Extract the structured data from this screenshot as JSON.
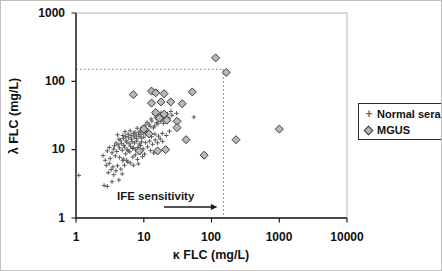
{
  "figure": {
    "legend": {
      "plus_glyph": "+",
      "entries": [
        {
          "label": "Normal sera",
          "marker": "plus"
        },
        {
          "label": "MGUS",
          "marker": "diamond"
        }
      ]
    }
  },
  "chart_data": {
    "type": "scatter",
    "title": "",
    "xlabel": "κ FLC (mg/L)",
    "ylabel": "λ FLC (mg/L)",
    "xscale": "log",
    "yscale": "log",
    "xlim": [
      1,
      10000
    ],
    "ylim": [
      1,
      1000
    ],
    "x_ticks": [
      "1",
      "10",
      "100",
      "1000",
      "10000"
    ],
    "y_ticks": [
      "1",
      "10",
      "100",
      "1000"
    ],
    "grid": false,
    "legend_position": "right-outside-boxed",
    "colors": {
      "plus": "#5a5a5a",
      "diamond_fill": "#b8b8b8",
      "diamond_stroke": "#3a3a3a",
      "dotted": "#777777",
      "axis": "#1a1a1a",
      "plot_border": "#b5b5b5"
    },
    "reference_lines": [
      {
        "axis": "x",
        "value": 150,
        "style": "dotted"
      },
      {
        "axis": "y",
        "value": 150,
        "style": "dotted"
      }
    ],
    "annotations": [
      {
        "text": "IFE sensitivity",
        "arrow": {
          "x1": 20,
          "x2": 122,
          "y": 1.45,
          "direction": "right"
        }
      }
    ],
    "series": [
      {
        "name": "Normal sera",
        "marker": "plus",
        "points": [
          [
            1.1,
            4.2
          ],
          [
            2.6,
            3.0
          ],
          [
            2.9,
            2.9
          ],
          [
            3.4,
            3.4
          ],
          [
            3.0,
            4.6
          ],
          [
            3.3,
            5.1
          ],
          [
            3.6,
            4.3
          ],
          [
            2.8,
            5.9
          ],
          [
            3.1,
            6.3
          ],
          [
            3.5,
            5.6
          ],
          [
            3.9,
            4.9
          ],
          [
            4.3,
            3.6
          ],
          [
            4.8,
            4.4
          ],
          [
            3.2,
            7.4
          ],
          [
            2.7,
            7.0
          ],
          [
            2.5,
            8.2
          ],
          [
            4.1,
            5.8
          ],
          [
            4.6,
            5.2
          ],
          [
            5.2,
            5.9
          ],
          [
            5.8,
            6.6
          ],
          [
            4.9,
            6.9
          ],
          [
            4.4,
            7.7
          ],
          [
            3.8,
            8.1
          ],
          [
            3.4,
            9.0
          ],
          [
            2.9,
            9.6
          ],
          [
            3.1,
            10.8
          ],
          [
            3.6,
            10.2
          ],
          [
            4.0,
            9.4
          ],
          [
            4.4,
            10.6
          ],
          [
            4.8,
            9.8
          ],
          [
            5.2,
            10.9
          ],
          [
            5.7,
            10.1
          ],
          [
            6.2,
            9.3
          ],
          [
            6.8,
            10.4
          ],
          [
            5.4,
            8.7
          ],
          [
            5.9,
            9.6
          ],
          [
            6.4,
            11.2
          ],
          [
            7.1,
            10.7
          ],
          [
            7.6,
            9.9
          ],
          [
            8.2,
            10.8
          ],
          [
            4.2,
            11.8
          ],
          [
            4.7,
            12.4
          ],
          [
            5.1,
            11.6
          ],
          [
            5.6,
            12.9
          ],
          [
            6.1,
            12.2
          ],
          [
            6.7,
            13.1
          ],
          [
            7.3,
            12.5
          ],
          [
            7.9,
            13.4
          ],
          [
            8.6,
            12.1
          ],
          [
            9.3,
            13.0
          ],
          [
            4.5,
            13.8
          ],
          [
            5.0,
            14.6
          ],
          [
            5.5,
            13.5
          ],
          [
            6.0,
            14.9
          ],
          [
            6.6,
            14.2
          ],
          [
            7.2,
            15.3
          ],
          [
            7.8,
            14.5
          ],
          [
            8.5,
            15.7
          ],
          [
            9.2,
            14.8
          ],
          [
            10.0,
            15.2
          ],
          [
            4.9,
            16.1
          ],
          [
            5.4,
            15.6
          ],
          [
            5.9,
            16.8
          ],
          [
            6.5,
            16.0
          ],
          [
            7.0,
            17.2
          ],
          [
            7.7,
            16.4
          ],
          [
            8.4,
            17.6
          ],
          [
            9.1,
            16.7
          ],
          [
            9.9,
            17.9
          ],
          [
            10.8,
            17.0
          ],
          [
            5.3,
            18.3
          ],
          [
            6.3,
            18.9
          ],
          [
            7.4,
            18.1
          ],
          [
            8.8,
            18.7
          ],
          [
            10.2,
            19.4
          ],
          [
            11.6,
            18.4
          ],
          [
            8.0,
            20.6
          ],
          [
            9.5,
            21.2
          ],
          [
            11.0,
            20.1
          ],
          [
            12.4,
            21.9
          ],
          [
            13.9,
            20.8
          ],
          [
            10.5,
            22.8
          ],
          [
            12.0,
            23.5
          ],
          [
            14.5,
            22.3
          ],
          [
            16.2,
            23.9
          ],
          [
            11.2,
            25.1
          ],
          [
            13.2,
            26.3
          ],
          [
            15.5,
            24.7
          ],
          [
            17.8,
            26.0
          ],
          [
            19.5,
            24.2
          ],
          [
            12.8,
            28.2
          ],
          [
            15.0,
            29.4
          ],
          [
            18.5,
            28.0
          ],
          [
            21.0,
            27.1
          ],
          [
            16.8,
            31.5
          ],
          [
            20.2,
            30.3
          ],
          [
            23.5,
            29.0
          ],
          [
            14.2,
            33.0
          ],
          [
            18.0,
            34.6
          ],
          [
            22.4,
            33.4
          ],
          [
            26.0,
            31.8
          ],
          [
            25.2,
            36.2
          ],
          [
            30.5,
            34.0
          ],
          [
            55.0,
            30.0
          ],
          [
            9.0,
            11.5
          ],
          [
            9.8,
            10.3
          ],
          [
            10.6,
            12.7
          ],
          [
            11.4,
            11.0
          ],
          [
            12.2,
            13.3
          ],
          [
            13.5,
            12.0
          ],
          [
            14.8,
            13.9
          ],
          [
            16.0,
            12.6
          ],
          [
            17.5,
            14.4
          ],
          [
            19.0,
            13.2
          ],
          [
            8.9,
            9.0
          ],
          [
            10.3,
            8.6
          ],
          [
            12.6,
            9.7
          ],
          [
            14.0,
            8.9
          ],
          [
            6.9,
            7.8
          ],
          [
            7.5,
            8.4
          ],
          [
            8.1,
            7.2
          ],
          [
            9.6,
            7.9
          ],
          [
            11.8,
            16.2
          ],
          [
            13.0,
            15.5
          ],
          [
            14.6,
            16.9
          ],
          [
            16.5,
            15.8
          ],
          [
            18.8,
            17.3
          ],
          [
            21.5,
            16.1
          ],
          [
            24.0,
            18.6
          ],
          [
            5.0,
            7.3
          ],
          [
            5.6,
            7.0
          ],
          [
            6.3,
            6.4
          ],
          [
            7.0,
            5.9
          ],
          [
            8.3,
            6.2
          ],
          [
            3.9,
            12.5
          ],
          [
            4.3,
            14.2
          ],
          [
            3.7,
            11.4
          ],
          [
            4.1,
            16.5
          ]
        ]
      },
      {
        "name": "MGUS",
        "marker": "diamond",
        "points": [
          [
            115,
            220
          ],
          [
            165,
            135
          ],
          [
            7,
            64
          ],
          [
            13,
            72
          ],
          [
            15,
            68
          ],
          [
            20,
            66
          ],
          [
            52,
            70
          ],
          [
            13,
            48
          ],
          [
            18,
            50
          ],
          [
            25,
            50
          ],
          [
            37,
            47
          ],
          [
            15,
            35
          ],
          [
            20,
            33
          ],
          [
            17,
            29
          ],
          [
            22,
            27
          ],
          [
            31,
            26
          ],
          [
            31,
            21
          ],
          [
            10,
            20
          ],
          [
            12,
            17
          ],
          [
            8.6,
            9.6
          ],
          [
            16,
            9.6
          ],
          [
            21,
            10
          ],
          [
            42,
            14
          ],
          [
            78,
            8.3
          ],
          [
            230,
            14
          ],
          [
            1000,
            20
          ]
        ]
      }
    ]
  }
}
